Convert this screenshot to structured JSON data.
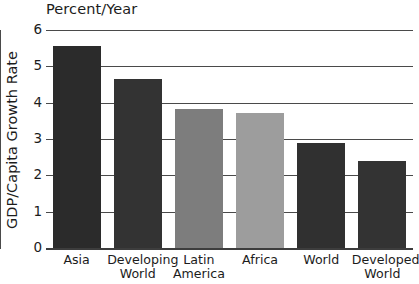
{
  "chart_data": {
    "type": "bar",
    "title": "Percent/Year",
    "xlabel": "",
    "ylabel": "GDP/Capita Growth Rate",
    "ylim": [
      0,
      6
    ],
    "yticks": [
      "6",
      "5",
      "4",
      "3",
      "2",
      "1",
      "0"
    ],
    "grid": true,
    "grid_orientation": "horizontal",
    "legend": "none",
    "categories": [
      "Asia",
      "Developing World",
      "Latin America",
      "Africa",
      "World",
      "Developed World"
    ],
    "values": [
      5.55,
      4.65,
      3.82,
      3.72,
      2.9,
      2.4
    ],
    "bar_colors": [
      "#2b2b2b",
      "#333333",
      "#7d7d7d",
      "#9d9d9d",
      "#303030",
      "#333333"
    ],
    "bars": [
      {
        "label": "Asia",
        "label_line2": "",
        "value": 5.55,
        "color": "#2b2b2b"
      },
      {
        "label": "Developing",
        "label_line2": "World",
        "value": 4.65,
        "color": "#333333"
      },
      {
        "label": "Latin",
        "label_line2": "America",
        "value": 3.82,
        "color": "#7d7d7d"
      },
      {
        "label": "Africa",
        "label_line2": "",
        "value": 3.72,
        "color": "#9d9d9d"
      },
      {
        "label": "World",
        "label_line2": "",
        "value": 2.9,
        "color": "#303030"
      },
      {
        "label": "Developed",
        "label_line2": "World",
        "value": 2.4,
        "color": "#333333"
      }
    ]
  },
  "colors": {
    "axis": "#4a4a4a",
    "text": "#1c1c1c",
    "background": "#ffffff"
  }
}
